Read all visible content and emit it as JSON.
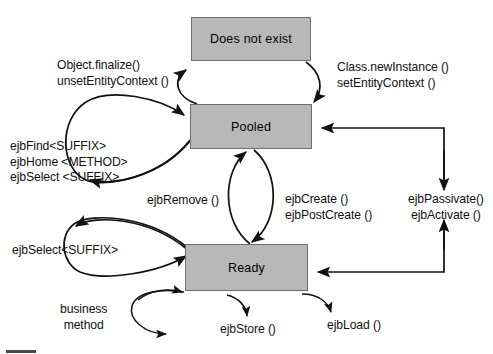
{
  "diagram": {
    "background_color": "#ffffff",
    "state_fill_color": "#b8b8b8",
    "state_border_color": "#6d6d6d",
    "line_color": "#111111",
    "states": [
      {
        "id": "does-not-exist",
        "label": "Does not exist"
      },
      {
        "id": "pooled",
        "label": "Pooled"
      },
      {
        "id": "ready",
        "label": "Ready"
      }
    ],
    "transitions": [
      {
        "id": "pooled-to-does-not-exist",
        "from": "Pooled",
        "to": "Does not exist",
        "lines": [
          "Object.finalize()",
          "unsetEntityContext ()"
        ]
      },
      {
        "id": "does-not-exist-to-pooled",
        "from": "Does not exist",
        "to": "Pooled",
        "lines": [
          "Class.newInstance ()",
          "setEntityContext ()"
        ]
      },
      {
        "id": "pooled-self-loop",
        "from": "Pooled",
        "to": "Pooled",
        "lines": [
          "ejbFind<SUFFIX>",
          "ejbHome <METHOD>",
          "ejbSelect <SUFFIX>"
        ]
      },
      {
        "id": "ready-to-pooled-remove",
        "from": "Ready",
        "to": "Pooled",
        "lines": [
          "ejbRemove ()"
        ]
      },
      {
        "id": "pooled-to-ready-create",
        "from": "Pooled",
        "to": "Ready",
        "lines": [
          "ejbCreate ()",
          "ejbPostCreate ()"
        ]
      },
      {
        "id": "passivate-activate",
        "from": "Ready",
        "to": "Pooled",
        "lines": [
          "ejbPassivate()",
          "ejbActivate ()"
        ]
      },
      {
        "id": "ready-self-loop-select",
        "from": "Ready",
        "to": "Ready",
        "lines": [
          "ejbSelect<SUFFIX>"
        ]
      },
      {
        "id": "ready-self-loop-business",
        "from": "Ready",
        "to": "Ready",
        "lines": [
          "business",
          "method"
        ]
      },
      {
        "id": "ready-ejbstore",
        "from": "Ready",
        "to": "Ready",
        "lines": [
          "ejbStore ()"
        ]
      },
      {
        "id": "ready-ejbload",
        "from": "Ready",
        "to": "Ready",
        "lines": [
          "ejbLoad ()"
        ]
      }
    ]
  }
}
